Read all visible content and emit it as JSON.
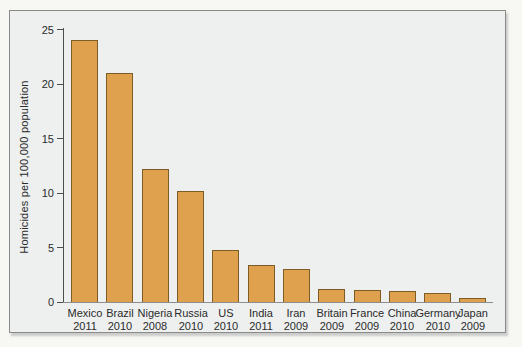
{
  "chart_data": {
    "type": "bar",
    "title": "",
    "xlabel": "",
    "ylabel": "Homicides per 100,000 population",
    "ylim": [
      0,
      25
    ],
    "yticks": [
      0,
      5,
      10,
      15,
      20,
      25
    ],
    "grid": false,
    "legend_position": "none",
    "categories": [
      "Mexico",
      "Brazil",
      "Nigeria",
      "Russia",
      "US",
      "India",
      "Iran",
      "Britain",
      "France",
      "China",
      "Germany",
      "Japan"
    ],
    "years": [
      "2011",
      "2010",
      "2008",
      "2010",
      "2010",
      "2011",
      "2009",
      "2009",
      "2009",
      "2010",
      "2010",
      "2009"
    ],
    "values": [
      24,
      21,
      12.2,
      10.2,
      4.8,
      3.4,
      3.0,
      1.2,
      1.1,
      1.0,
      0.8,
      0.4
    ]
  },
  "colors": {
    "bar_fill": "#dfa14e",
    "bar_border": "#7d5c26",
    "chart_background": "#edf0ef",
    "page_background": "#f7f7f4",
    "frame_border": "#8a8a8a",
    "axis_color": "#4d4d4d",
    "text_color": "#2b2b2b"
  }
}
